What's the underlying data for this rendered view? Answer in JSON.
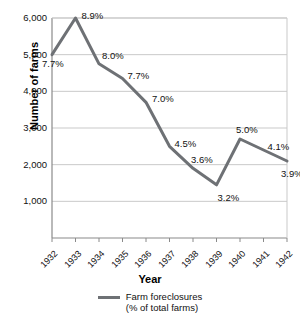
{
  "chart_data": {
    "type": "line",
    "title": "",
    "xlabel": "Year",
    "ylabel": "Number of farms",
    "categories": [
      "1932",
      "1933",
      "1934",
      "1935",
      "1936",
      "1937",
      "1938",
      "1939",
      "1940",
      "1941",
      "1942"
    ],
    "values": [
      5000,
      6000,
      4750,
      4350,
      3700,
      2500,
      1900,
      1450,
      2700,
      2400,
      2100
    ],
    "point_labels": [
      "7.7%",
      "8.9%",
      "8.0%",
      "7.7%",
      "7.0%",
      "4.5%",
      "3.6%",
      "3.2%",
      "5.0%",
      "4.1%",
      "3.9%"
    ],
    "ylim": [
      0,
      6000
    ],
    "yticks": [
      "1,000",
      "2,000",
      "3,000",
      "4,000",
      "5,000",
      "6,000"
    ],
    "ytick_values": [
      1000,
      2000,
      3000,
      4000,
      5000,
      6000
    ],
    "grid": true,
    "legend_position": "bottom",
    "series": [
      {
        "name": "Farm foreclosures",
        "sublabel": "(% of total farms)",
        "color": "#6e7175",
        "values": [
          5000,
          6000,
          4750,
          4350,
          3700,
          2500,
          1900,
          1450,
          2700,
          2400,
          2100
        ]
      }
    ]
  },
  "legend": {
    "line1": "Farm foreclosures",
    "line2": "(% of total farms)"
  },
  "colors": {
    "line": "#6e7175",
    "grid": "#c9c9c9",
    "axis": "#8a8a8a",
    "text": "#111111"
  }
}
